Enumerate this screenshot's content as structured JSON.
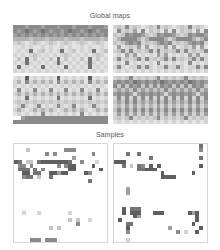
{
  "titles": {
    "global": "Global maps",
    "samples": "Samples"
  },
  "palette": [
    "#ffffff",
    "#f1f1f1",
    "#e3e3e3",
    "#d4d4d4",
    "#c4c4c4",
    "#b2b2b2",
    "#9f9f9f",
    "#8a8a8a",
    "#747474",
    "#5e5e5e"
  ],
  "global_maps": [
    {
      "name": "global-map-top-left",
      "rows": [
        "777677767776777677767776",
        "767876787677678776787677",
        "676767676767676767676767",
        "555545554555545554555545",
        "343234323432343234323432",
        "223232232322323223232232",
        "232382342323823423238234",
        "323234323232343232323432",
        "242824232428242324282423",
        "323832323238323232383232",
        "282323282323282323282323",
        "323232323232323232323232"
      ]
    },
    {
      "name": "global-map-top-right",
      "rows": [
        "343734323437343234373432",
        "273436272434262724342627",
        "434767764347677643476776",
        "357777535777753577775357",
        "434676734346767343467673",
        "262343626234362623436262",
        "347373434737343473734347",
        "232636232326362323263623",
        "373434737343473734347373",
        "232723232327232323272323",
        "373233737323373373233737",
        "232323232323232323232323"
      ]
    },
    {
      "name": "global-map-bottom-left",
      "rows": [
        "232923232329232323292323",
        "352735353527353535273535",
        "323232323232323232323232",
        "272327232723272327232723",
        "353535353535353535353535",
        "232823232328232323282323",
        "343434343434343434343434",
        "237323723237323723237323",
        "353235353532353535323535",
        "232323272323232327232323",
        "006777777777777777777777",
        "777777777777777777777777"
      ]
    },
    {
      "name": "global-map-bottom-right",
      "rows": [
        "343473434347343434734343",
        "676768767676876767687676",
        "747476747474767474747674",
        "464647464646474646464746",
        "676763676767636767676367",
        "373737373737373737373737",
        "464747464647474646474746",
        "353636353536363535363635",
        "474747474747474747474747",
        "363636363636363636363636",
        "343473434347343434734343",
        "232323232323232323232323"
      ]
    }
  ],
  "samples": [
    {
      "name": "sample-top-left",
      "rows": [
        "000000000000000000000000",
        "000400000000077700000000",
        "000000007070000000007000",
        "000000000000000600000000",
        "980440899999998007000300",
        "077070000007079900009000",
        "088808070000009900000090",
        "009908800996990000970000",
        "007880400800000000000000",
        "000000000000000000080000",
        "000000000000000000000000",
        "000000000000000000000000",
        "000000000000000000000000",
        "000000000000000000000000",
        "000000000000000000000000",
        "000000000000000000000000",
        "000000000000000000000000",
        "003000300000003000000000",
        "000000000000000000000000",
        "000000000000004040030000",
        "000000000000000070000000",
        "000000000404000000000000",
        "000000000000000000000000",
        "000000000000000000000000",
        "000077707770000000000000"
      ]
    },
    {
      "name": "sample-top-right",
      "rows": [
        "000000000000000000000080",
        "000000000000000000000070",
        "000800800000000000000000",
        "000000000800000000000080",
        "999000000000000000000000",
        "008040870909000000000090",
        "000000889990000000000000",
        "000000000000900000009000",
        "000000000000999900000000",
        "000000000000000000000000",
        "000000000000000000000000",
        "000600000000000000000000",
        "000600000000000000000000",
        "000000000000000000000000",
        "000000000000000000000000",
        "000000000000000000000000",
        "009088800000000000000000",
        "009099900099900000096900",
        "000009600000000000000900",
        "090000000000000000000900",
        "000880000000000000009000",
        "000900000000006000000090",
        "000700000000000070300900",
        "000000000000000000000000",
        "000300000000000000000000"
      ]
    }
  ]
}
